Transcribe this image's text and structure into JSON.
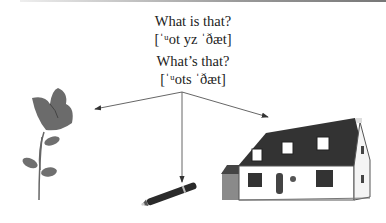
{
  "question_long": "What is that?",
  "phonetic_long": "[ˈᵘot yz ˈðæt]",
  "question_short": "What’s that?",
  "phonetic_short": "[ˈᵘots ˈðæt]",
  "illustrations": [
    "rose",
    "fountain-pen",
    "house"
  ]
}
